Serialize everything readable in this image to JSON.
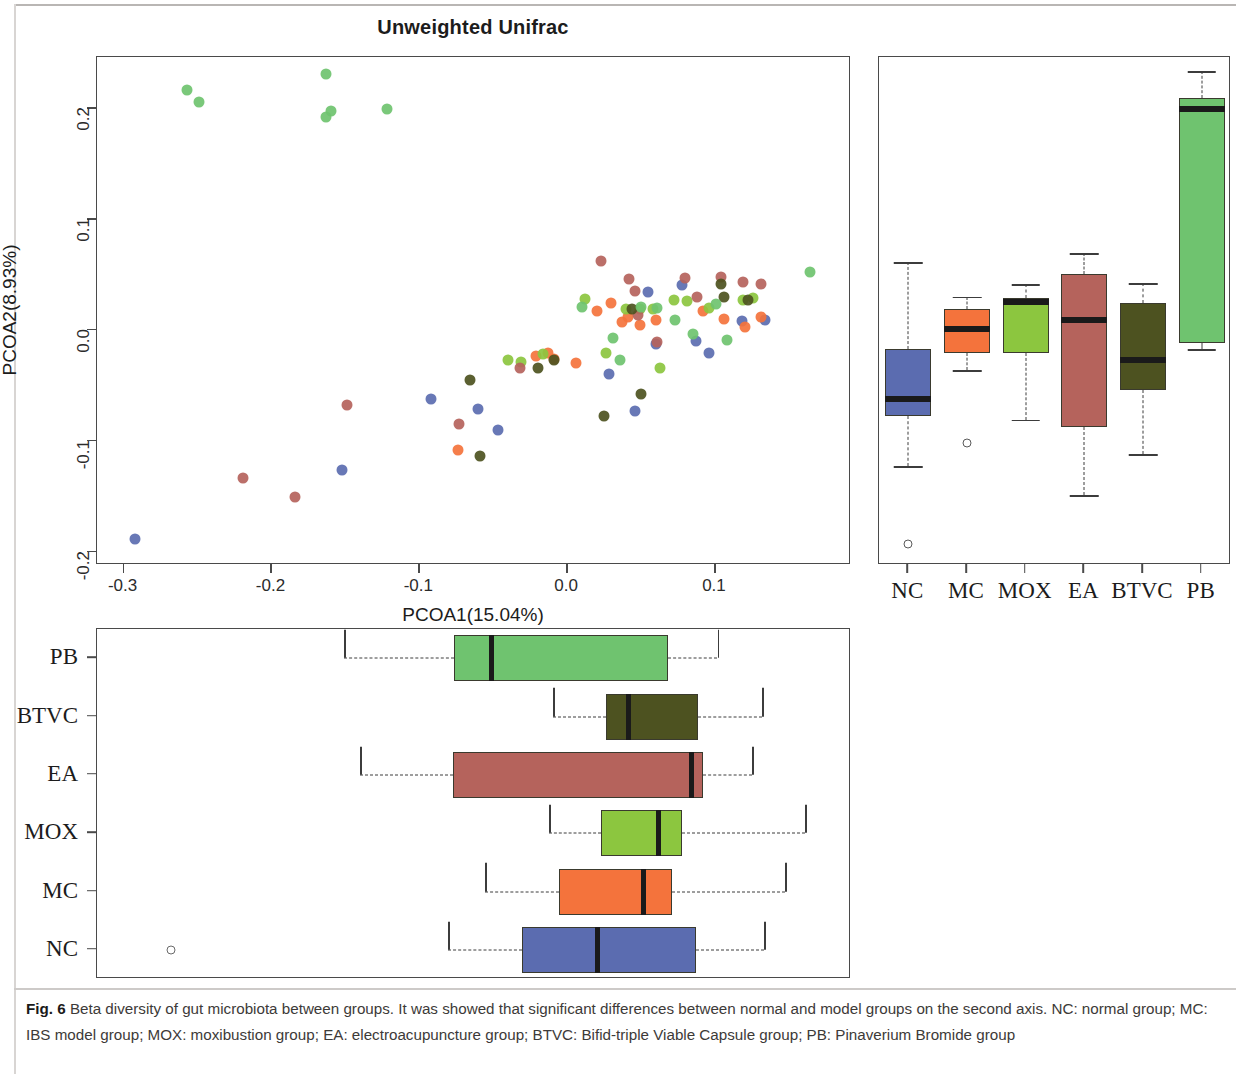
{
  "figure": {
    "label": "Fig. 6",
    "caption": "Beta diversity of gut microbiota between groups. It was showed that significant differences between normal and model groups on the second axis. NC: normal group; MC: IBS model group; MOX: moxibustion group; EA: electroacupuncture group; BTVC: Bifid-triple Viable Capsule group; PB: Pinaverium Bromide group"
  },
  "groups": [
    {
      "key": "NC",
      "label": "NC",
      "color": "#5b6cb0",
      "description": "normal group"
    },
    {
      "key": "MC",
      "label": "MC",
      "color": "#f4733c",
      "description": "IBS model group"
    },
    {
      "key": "MOX",
      "label": "MOX",
      "color": "#8cc63f",
      "description": "moxibustion group"
    },
    {
      "key": "EA",
      "label": "EA",
      "color": "#b5635c",
      "description": "electroacupuncture group"
    },
    {
      "key": "BTVC",
      "label": "BTVC",
      "color": "#4d5220",
      "description": "Bifid-triple Viable Capsule group"
    },
    {
      "key": "PB",
      "label": "PB",
      "color": "#6fc36f",
      "description": "Pinaverium Bromide group"
    }
  ],
  "chart_data": [
    {
      "type": "scatter",
      "title": "Unweighted Unifrac",
      "xlabel": "PCOA1(15.04%)",
      "ylabel": "PCOA2(8.93%)",
      "xlim": [
        -0.318,
        0.192
      ],
      "ylim": [
        -0.212,
        0.246
      ],
      "xticks": [
        -0.3,
        -0.2,
        -0.1,
        0.0,
        0.1
      ],
      "xticklabels": [
        "-0.3",
        "-0.2",
        "-0.1",
        "0.0",
        "0.1"
      ],
      "yticks": [
        -0.2,
        -0.1,
        0.0,
        0.1,
        0.2
      ],
      "yticklabels": [
        "-0.2",
        "-0.1",
        "0.0",
        "0.1",
        "0.2"
      ],
      "grid": false,
      "legend": "none",
      "series": [
        {
          "name": "NC",
          "color": "#5b6cb0",
          "points": [
            [
              -0.292,
              -0.189
            ],
            [
              -0.152,
              -0.126
            ],
            [
              -0.092,
              -0.062
            ],
            [
              -0.06,
              -0.071
            ],
            [
              -0.047,
              -0.09
            ],
            [
              0.028,
              -0.04
            ],
            [
              0.046,
              -0.073
            ],
            [
              0.055,
              0.034
            ],
            [
              0.06,
              -0.013
            ],
            [
              0.078,
              0.04
            ],
            [
              0.087,
              -0.01
            ],
            [
              0.096,
              -0.021
            ],
            [
              0.118,
              0.008
            ],
            [
              0.134,
              0.009
            ]
          ]
        },
        {
          "name": "MC",
          "color": "#f4733c",
          "points": [
            [
              -0.074,
              -0.108
            ],
            [
              -0.021,
              -0.024
            ],
            [
              -0.013,
              -0.021
            ],
            [
              -0.009,
              -0.026
            ],
            [
              0.006,
              -0.03
            ],
            [
              0.02,
              0.017
            ],
            [
              0.03,
              0.024
            ],
            [
              0.037,
              0.007
            ],
            [
              0.041,
              0.012
            ],
            [
              0.049,
              0.004
            ],
            [
              0.06,
              0.009
            ],
            [
              0.092,
              0.017
            ],
            [
              0.106,
              0.01
            ],
            [
              0.12,
              0.003
            ],
            [
              0.131,
              0.012
            ]
          ]
        },
        {
          "name": "MOX",
          "color": "#8cc63f",
          "points": [
            [
              -0.04,
              -0.027
            ],
            [
              -0.031,
              -0.029
            ],
            [
              -0.016,
              -0.022
            ],
            [
              0.012,
              0.028
            ],
            [
              0.026,
              -0.021
            ],
            [
              0.04,
              0.019
            ],
            [
              0.049,
              0.019
            ],
            [
              0.058,
              0.019
            ],
            [
              0.063,
              -0.034
            ],
            [
              0.072,
              0.027
            ],
            [
              0.081,
              0.026
            ],
            [
              0.096,
              0.02
            ],
            [
              0.119,
              0.027
            ],
            [
              0.126,
              0.029
            ]
          ]
        },
        {
          "name": "EA",
          "color": "#b5635c",
          "points": [
            [
              -0.219,
              -0.134
            ],
            [
              -0.184,
              -0.151
            ],
            [
              -0.149,
              -0.068
            ],
            [
              -0.073,
              -0.085
            ],
            [
              -0.032,
              -0.034
            ],
            [
              0.023,
              0.062
            ],
            [
              0.042,
              0.046
            ],
            [
              0.046,
              0.035
            ],
            [
              0.048,
              0.013
            ],
            [
              0.061,
              -0.011
            ],
            [
              0.08,
              0.047
            ],
            [
              0.088,
              0.03
            ],
            [
              0.104,
              0.048
            ],
            [
              0.119,
              0.043
            ],
            [
              0.131,
              0.041
            ]
          ]
        },
        {
          "name": "BTVC",
          "color": "#4d5220",
          "points": [
            [
              -0.066,
              -0.045
            ],
            [
              -0.059,
              -0.114
            ],
            [
              -0.02,
              -0.034
            ],
            [
              -0.009,
              -0.027
            ],
            [
              0.025,
              -0.078
            ],
            [
              0.044,
              0.019
            ],
            [
              0.05,
              -0.058
            ],
            [
              0.104,
              0.041
            ],
            [
              0.106,
              0.03
            ],
            [
              0.122,
              0.027
            ]
          ]
        },
        {
          "name": "PB",
          "color": "#6fc36f",
          "points": [
            [
              -0.257,
              0.216
            ],
            [
              -0.249,
              0.205
            ],
            [
              -0.163,
              0.231
            ],
            [
              -0.16,
              0.197
            ],
            [
              -0.163,
              0.192
            ],
            [
              -0.122,
              0.199
            ],
            [
              0.01,
              0.021
            ],
            [
              0.031,
              -0.007
            ],
            [
              0.036,
              -0.027
            ],
            [
              0.05,
              0.021
            ],
            [
              0.061,
              0.02
            ],
            [
              0.073,
              0.009
            ],
            [
              0.085,
              -0.004
            ],
            [
              0.101,
              0.023
            ],
            [
              0.108,
              -0.009
            ],
            [
              0.164,
              0.052
            ]
          ]
        }
      ]
    },
    {
      "type": "box",
      "orientation": "vertical",
      "axis_reference": "PCOA2(8.93%)",
      "categories": [
        "NC",
        "MC",
        "MOX",
        "EA",
        "BTVC",
        "PB"
      ],
      "boxes": [
        {
          "group": "NC",
          "whisker_low": -0.123,
          "q1": -0.078,
          "median": -0.062,
          "q3": -0.017,
          "whisker_high": 0.061,
          "outliers": [
            -0.193
          ]
        },
        {
          "group": "MC",
          "whisker_low": -0.036,
          "q1": -0.021,
          "median": 0.001,
          "q3": 0.019,
          "whisker_high": 0.03,
          "outliers": [
            -0.102
          ]
        },
        {
          "group": "MOX",
          "whisker_low": -0.081,
          "q1": -0.021,
          "median": 0.025,
          "q3": 0.029,
          "whisker_high": 0.041,
          "outliers": []
        },
        {
          "group": "EA",
          "whisker_low": -0.149,
          "q1": -0.088,
          "median": 0.009,
          "q3": 0.05,
          "whisker_high": 0.069,
          "outliers": []
        },
        {
          "group": "BTVC",
          "whisker_low": -0.112,
          "q1": -0.054,
          "median": -0.027,
          "q3": 0.024,
          "whisker_high": 0.042,
          "outliers": []
        },
        {
          "group": "PB",
          "whisker_low": -0.017,
          "q1": -0.012,
          "median": 0.199,
          "q3": 0.209,
          "whisker_high": 0.233,
          "outliers": []
        }
      ]
    },
    {
      "type": "box",
      "orientation": "horizontal",
      "axis_reference": "PCOA1(15.04%)",
      "categories": [
        "NC",
        "MC",
        "MOX",
        "EA",
        "BTVC",
        "PB"
      ],
      "row_order_top_to_bottom": [
        "PB",
        "BTVC",
        "EA",
        "MOX",
        "MC",
        "NC"
      ],
      "boxes": [
        {
          "group": "NC",
          "whisker_low": -0.034,
          "q1": 0.026,
          "median": 0.087,
          "q3": 0.167,
          "whisker_high": 0.222,
          "outliers": [
            -0.258
          ]
        },
        {
          "group": "MC",
          "whisker_low": -0.004,
          "q1": 0.056,
          "median": 0.124,
          "q3": 0.147,
          "whisker_high": 0.239,
          "outliers": []
        },
        {
          "group": "MOX",
          "whisker_low": 0.048,
          "q1": 0.09,
          "median": 0.136,
          "q3": 0.155,
          "whisker_high": 0.255,
          "outliers": []
        },
        {
          "group": "EA",
          "whisker_low": -0.105,
          "q1": -0.03,
          "median": 0.163,
          "q3": 0.172,
          "whisker_high": 0.212,
          "outliers": []
        },
        {
          "group": "BTVC",
          "whisker_low": 0.051,
          "q1": 0.094,
          "median": 0.112,
          "q3": 0.168,
          "whisker_high": 0.22,
          "outliers": []
        },
        {
          "group": "PB",
          "whisker_low": -0.118,
          "q1": -0.029,
          "median": 0.001,
          "q3": 0.144,
          "whisker_high": 0.184,
          "outliers": []
        }
      ]
    }
  ]
}
